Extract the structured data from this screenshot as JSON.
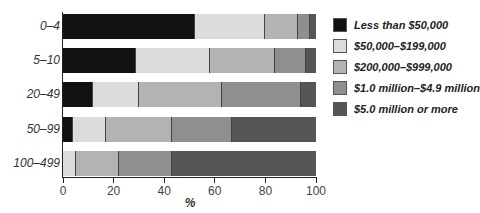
{
  "chart_data": {
    "type": "bar",
    "orientation": "horizontal",
    "stacked": true,
    "title": "",
    "xlabel": "%",
    "ylabel": "",
    "xlim": [
      0,
      100
    ],
    "xticks": [
      "0",
      "20",
      "40",
      "60",
      "80",
      "100"
    ],
    "categories": [
      "0–4",
      "5–10",
      "20–49",
      "50–99",
      "100–499"
    ],
    "series": [
      {
        "name": "Less than $50,000",
        "color": "#111111",
        "values": [
          52,
          29,
          12,
          4,
          0
        ]
      },
      {
        "name": "$50,000–$199,000",
        "color": "#dcdcdc",
        "values": [
          28,
          29,
          18,
          13,
          5
        ]
      },
      {
        "name": "$200,000–$999,000",
        "color": "#b3b3b3",
        "values": [
          13,
          26,
          33,
          26,
          17
        ]
      },
      {
        "name": "$1.0 million–$4.9 million",
        "color": "#8f8f8f",
        "values": [
          4.5,
          12,
          31,
          24,
          21
        ]
      },
      {
        "name": "$5.0 million or more",
        "color": "#555555",
        "values": [
          2.5,
          4,
          6,
          33,
          57
        ]
      }
    ],
    "grid": false,
    "legend_position": "right"
  }
}
